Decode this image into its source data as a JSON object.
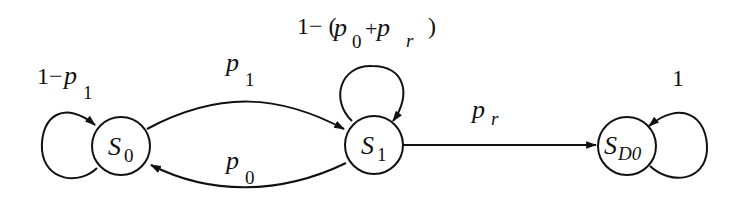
{
  "diagram": {
    "type": "state-transition-diagram",
    "states": [
      {
        "id": "S0",
        "main": "S",
        "sub": "0"
      },
      {
        "id": "S1",
        "main": "S",
        "sub": "1"
      },
      {
        "id": "SD0",
        "main": "S",
        "sub": "D0"
      }
    ],
    "transitions": [
      {
        "from": "S0",
        "to": "S0",
        "label": "1−p1",
        "parts": {
          "pre": "1−",
          "var": "p",
          "sub": "1"
        }
      },
      {
        "from": "S0",
        "to": "S1",
        "label": "p1",
        "parts": {
          "var": "p",
          "sub": "1"
        }
      },
      {
        "from": "S1",
        "to": "S0",
        "label": "p0",
        "parts": {
          "var": "p",
          "sub": "0"
        }
      },
      {
        "from": "S1",
        "to": "S1",
        "label": "1−(p0+pr)",
        "parts": {
          "pre": "1− (",
          "var1": "p",
          "sub1": "0",
          "plus": "+",
          "var2": "p",
          "sub2": "r",
          "post": ")"
        }
      },
      {
        "from": "S1",
        "to": "SD0",
        "label": "pr",
        "parts": {
          "var": "p",
          "sub": "r"
        }
      },
      {
        "from": "SD0",
        "to": "SD0",
        "label": "1",
        "parts": {
          "text": "1"
        }
      }
    ]
  }
}
